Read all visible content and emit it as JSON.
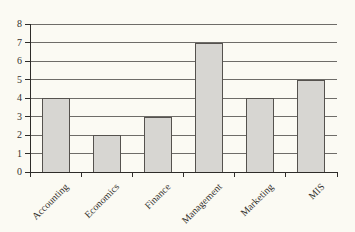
{
  "chart_data": {
    "type": "bar",
    "title": "",
    "xlabel": "",
    "ylabel": "",
    "categories": [
      "Accounting",
      "Economics",
      "Finance",
      "Management",
      "Marketing",
      "MIS"
    ],
    "values": [
      4,
      2,
      3,
      7,
      4,
      5
    ],
    "ylim": [
      0,
      8
    ],
    "ytick_step": 1,
    "yticks": [
      0,
      1,
      2,
      3,
      4,
      5,
      6,
      7,
      8
    ],
    "grid": true,
    "legend": false,
    "colors": {
      "page_background": "#fbfaf3",
      "bar_fill": "#d7d6d2",
      "bar_border": "#55524e",
      "gridline": "#6e6c68",
      "axis": "#2e2c29",
      "text": "#34312d"
    }
  }
}
